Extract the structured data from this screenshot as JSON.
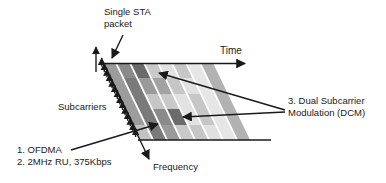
{
  "diagram": {
    "title_hint": "OFDMA single-STA packet with Dual Subcarrier Modulation",
    "labels": {
      "single_sta_line1": "Single STA",
      "single_sta_line2": "packet",
      "time": "Time",
      "subcarriers": "Subcarriers",
      "ofdma_line1": "1. OFDMA",
      "ofdma_line2": "2. 2MHz RU, 375Kbps",
      "frequency": "Frequency",
      "dcm_line1": "3. Dual Subcarrier",
      "dcm_line2": "Modulation (DCM)"
    },
    "grid": {
      "columns": 8,
      "rows": 5,
      "cell_colors": [
        [
          "#9c9c9c",
          "#8a8a8a",
          "#6b6b6b",
          "#c9c9c9",
          "#e2e2e2",
          "#c6c6c6",
          "#e6e6e6",
          "#b2b2b2"
        ],
        [
          "#9c9c9c",
          "#7a7a7a",
          "#9a9a9a",
          "#a2a2a2",
          "#c6c6c6",
          "#e0e0e0",
          "#e6e6e6",
          "#b2b2b2"
        ],
        [
          "#9c9c9c",
          "#7a7a7a",
          "#c6c6c6",
          "#c9c9c9",
          "#e2e2e2",
          "#c6c6c6",
          "#e6e6e6",
          "#b2b2b2"
        ],
        [
          "#9c9c9c",
          "#7a7a7a",
          "#8a8a8a",
          "#6b6b6b",
          "#e2e2e2",
          "#c6c6c6",
          "#e6e6e6",
          "#b2b2b2"
        ],
        [
          "#c2c2c2",
          "#7a7a7a",
          "#9a9a9a",
          "#c9c9c9",
          "#c6c6c6",
          "#e0e0e0",
          "#e6e6e6",
          "#b2b2b2"
        ]
      ],
      "dcm_highlight_color": "#6b6b6b",
      "dcm_cells": [
        {
          "col": 3,
          "row": 1
        },
        {
          "col": 4,
          "row": 4
        }
      ],
      "ofdma_cell": {
        "col": 3,
        "row": 4
      }
    },
    "subcarrier_arrow_count": 14,
    "colors": {
      "line": "#1a1a1a",
      "background": "#ffffff"
    }
  }
}
